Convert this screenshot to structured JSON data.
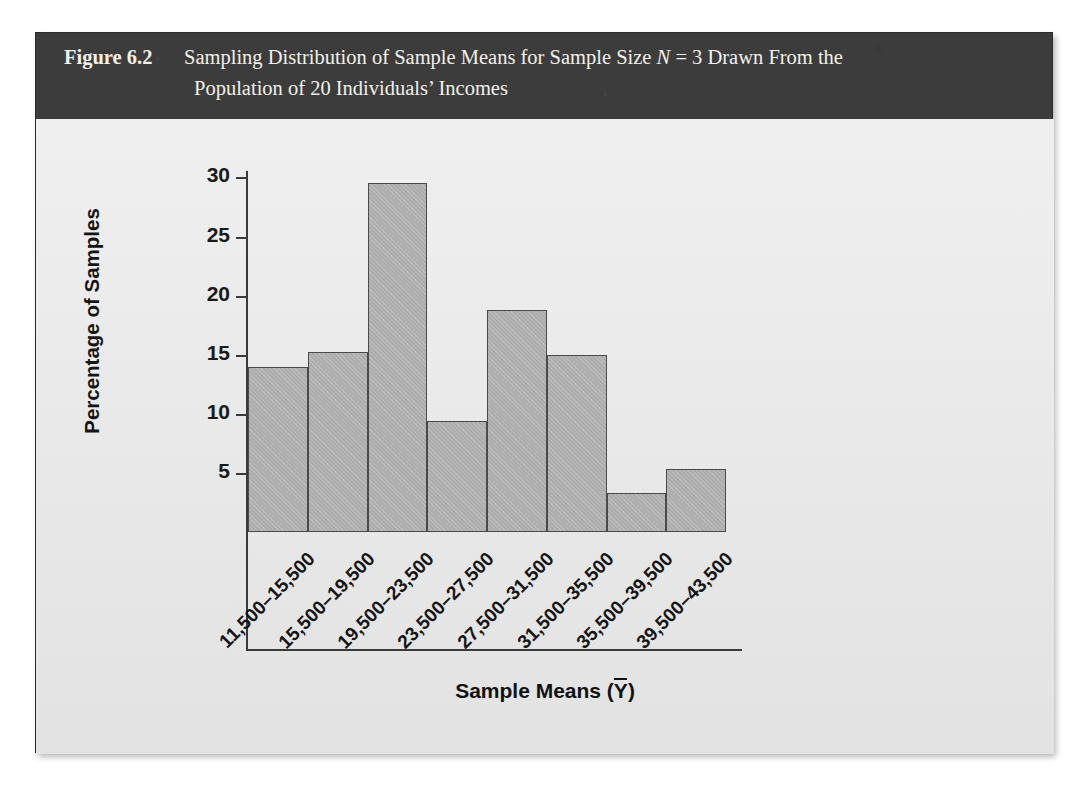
{
  "figure": {
    "label": "Figure 6.2",
    "caption_line1_pre": "Sampling Distribution of Sample Means for Sample Size ",
    "caption_line1_italic": "N",
    "caption_line1_post": " = 3 Drawn From the",
    "caption_line2": "Population of 20 Individuals’ Incomes",
    "band_color": "#3c3c3c",
    "panel_color": "#e7e7e7",
    "bar_color": "#b3b3b3",
    "bar_border_color": "#4a4a4a"
  },
  "chart_data": {
    "type": "bar",
    "title": "Sampling Distribution of Sample Means for Sample Size N = 3 Drawn From the Population of 20 Individuals’ Incomes",
    "xlabel": "Sample Means (Ȳ)",
    "ylabel": "Percentage of Samples",
    "categories": [
      "11,500–15,500",
      "15,500–19,500",
      "19,500–23,500",
      "23,500–27,500",
      "27,500–31,500",
      "31,500–35,500",
      "35,500–39,500",
      "39,500–43,500"
    ],
    "values": [
      14.0,
      15.2,
      29.5,
      9.4,
      18.8,
      15.0,
      3.3,
      5.3
    ],
    "ytick_labels": [
      "5",
      "10",
      "15",
      "20",
      "25",
      "30"
    ],
    "ytick_values": [
      5,
      10,
      15,
      20,
      25,
      30
    ],
    "ylim": [
      0,
      32
    ],
    "grid": false,
    "legend": "none",
    "xlabel_rotation_deg": -45
  }
}
